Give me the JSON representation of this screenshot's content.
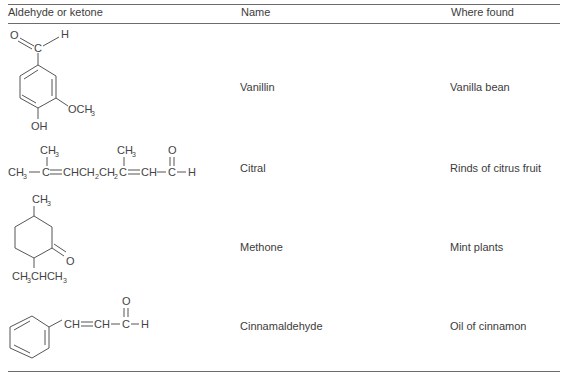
{
  "table": {
    "headers": [
      "Aldehyde or ketone",
      "Name",
      "Where found"
    ],
    "rows": [
      {
        "structure": {
          "labels": {
            "o": "O",
            "c": "C",
            "h": "H",
            "och3": "OCH",
            "och3_sub": "3",
            "oh": "OH"
          }
        },
        "name": "Vanillin",
        "where_found": "Vanilla bean"
      },
      {
        "structure": {
          "labels": {
            "ch3_left": "CH",
            "sub3": "3",
            "o": "O",
            "h": "H",
            "chain": [
              "CH",
              "C",
              "CHCH",
              "CH",
              "C",
              "CH",
              "C",
              "H"
            ]
          }
        },
        "name": "Citral",
        "where_found": "Rinds of citrus fruit"
      },
      {
        "structure": {
          "labels": {
            "ch3": "CH",
            "sub3": "3",
            "o": "O",
            "isopropyl": "CH",
            "isopropyl_mid": "CHCH"
          }
        },
        "name": "Methone",
        "where_found": "Mint plants"
      },
      {
        "structure": {
          "labels": {
            "ch1": "CH",
            "ch2": "CH",
            "c": "C",
            "o": "O",
            "h": "H"
          }
        },
        "name": "Cinnamaldehyde",
        "where_found": "Oil of cinnamon"
      }
    ]
  }
}
